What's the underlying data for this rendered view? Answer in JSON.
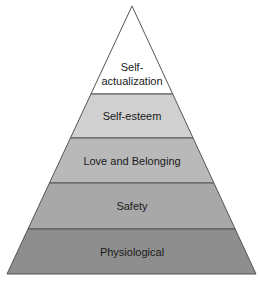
{
  "diagram": {
    "type": "pyramid",
    "levels_top_to_bottom": [
      {
        "id": "self-actualization",
        "lines": [
          "Self-",
          "actualization"
        ],
        "fill": "#ffffff"
      },
      {
        "id": "self-esteem",
        "lines": [
          "Self-esteem"
        ],
        "fill": "#d0d0d0"
      },
      {
        "id": "love-and-belonging",
        "lines": [
          "Love and Belonging"
        ],
        "fill": "#b9b9b9"
      },
      {
        "id": "safety",
        "lines": [
          "Safety"
        ],
        "fill": "#a8a8a8"
      },
      {
        "id": "physiological",
        "lines": [
          "Physiological"
        ],
        "fill": "#8e8e8e"
      }
    ],
    "outline_color": "#555555"
  }
}
